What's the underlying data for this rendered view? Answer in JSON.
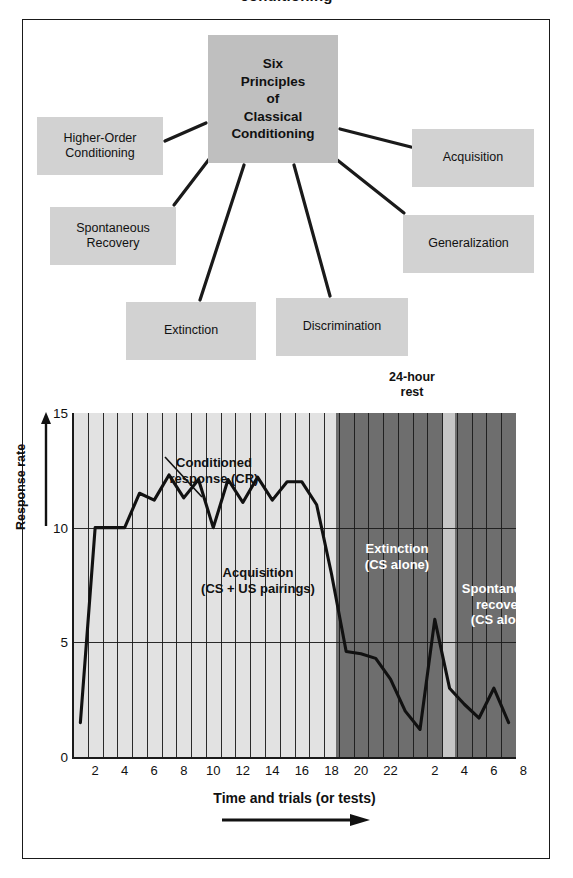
{
  "page": {
    "title_cropped": "conditioning"
  },
  "concept_map": {
    "center": {
      "lines": [
        "Six",
        "Principles",
        "of",
        "Classical",
        "Conditioning"
      ],
      "label": "Six Principles of Classical Conditioning"
    },
    "nodes": [
      {
        "id": "higher-order-conditioning",
        "lines": [
          "Higher-Order",
          "Conditioning"
        ],
        "label": "Higher-Order Conditioning"
      },
      {
        "id": "acquisition",
        "lines": [
          "Acquisition"
        ],
        "label": "Acquisition"
      },
      {
        "id": "spontaneous-recovery",
        "lines": [
          "Spontaneous",
          "Recovery"
        ],
        "label": "Spontaneous Recovery"
      },
      {
        "id": "generalization",
        "lines": [
          "Generalization"
        ],
        "label": "Generalization"
      },
      {
        "id": "extinction",
        "lines": [
          "Extinction"
        ],
        "label": "Extinction"
      },
      {
        "id": "discrimination",
        "lines": [
          "Discrimination"
        ],
        "label": "Discrimination"
      }
    ],
    "colors": {
      "center_fill": "#bfbfbf",
      "node_fill": "#d2d2d2",
      "connector": "#1a1a1a"
    }
  },
  "chart_data": {
    "type": "line",
    "title": "",
    "xlabel": "Time and trials (or tests)",
    "ylabel": "Response rate",
    "ylim": [
      0,
      15
    ],
    "yticks": [
      0,
      5,
      10,
      15
    ],
    "ytick_labels": [
      "0",
      "5",
      "10",
      "15"
    ],
    "grid": true,
    "xtick_labels": [
      "2",
      "4",
      "6",
      "8",
      "10",
      "12",
      "14",
      "16",
      "18",
      "20",
      "22",
      "2",
      "4",
      "6",
      "8"
    ],
    "x_trials": [
      1,
      2,
      3,
      4,
      5,
      6,
      7,
      8,
      9,
      10,
      11,
      12,
      13,
      14,
      15,
      16,
      17,
      18,
      19,
      20,
      21,
      22,
      23,
      24,
      25,
      26,
      27,
      28,
      29,
      30
    ],
    "values": [
      1.5,
      10,
      10,
      10,
      11.5,
      11.2,
      12.3,
      11.3,
      12.1,
      10.0,
      12.1,
      11.1,
      12.2,
      11.2,
      12.0,
      12.0,
      11.0,
      8.0,
      4.6,
      4.5,
      4.3,
      3.4,
      2.0,
      1.2,
      6.0,
      3.0,
      2.3,
      1.7,
      3.0,
      1.5
    ],
    "series": [
      {
        "name": "Conditioned response (CR)",
        "values": [
          1.5,
          10,
          10,
          10,
          11.5,
          11.2,
          12.3,
          11.3,
          12.1,
          10.0,
          12.1,
          11.1,
          12.2,
          11.2,
          12.0,
          12.0,
          11.0,
          8.0,
          4.6,
          4.5,
          4.3,
          3.4,
          2.0,
          1.2,
          6.0,
          3.0,
          2.3,
          1.7,
          3.0,
          1.5
        ]
      }
    ],
    "annotations": {
      "cr_callout": {
        "lines": [
          "Conditioned",
          "response (CR)"
        ],
        "text": "Conditioned response (CR)"
      },
      "rest_note": {
        "lines": [
          "24-hour",
          "rest"
        ],
        "text": "24-hour rest"
      }
    },
    "phases": [
      {
        "id": "acquisition",
        "lines": [
          "Acquisition",
          "(CS + US pairings)"
        ],
        "text": "Acquisition (CS + US pairings)",
        "band_color": "#e2e2e2",
        "text_color": "#111111"
      },
      {
        "id": "extinction",
        "lines": [
          "Extinction",
          "(CS alone)"
        ],
        "text": "Extinction (CS alone)",
        "band_color": "#6e6e6e",
        "text_color": "#ffffff"
      },
      {
        "id": "rest-gap",
        "lines": [],
        "text": "",
        "band_color": "#c6c6c6",
        "text_color": "#111111"
      },
      {
        "id": "spontaneous-recovery",
        "lines": [
          "Spontaneous",
          "recovery",
          "(CS alone)"
        ],
        "text": "Spontaneous recovery (CS alone)",
        "band_color": "#6e6e6e",
        "text_color": "#ffffff"
      }
    ],
    "axis_arrow": "right-arrow",
    "ylabel_arrow": "up-arrow"
  }
}
